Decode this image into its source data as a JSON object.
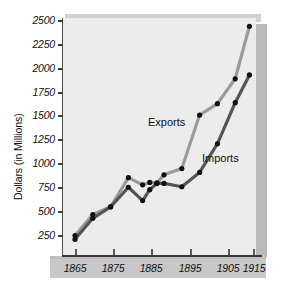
{
  "chart_data": {
    "type": "line",
    "title": "",
    "subtitle": "",
    "xlabel": "",
    "ylabel": "Dollars (in Millions)",
    "xlim": [
      1863,
      1916
    ],
    "ylim": [
      0,
      2600
    ],
    "grid": false,
    "legend_position": "inline-annotation",
    "x_ticks": [
      "1865",
      "1875",
      "1885",
      "1895",
      "1905",
      "1915"
    ],
    "x_tick_values": [
      1865,
      1875,
      1885,
      1895,
      1905,
      1915
    ],
    "y_ticks": [
      "250",
      "500",
      "750",
      "1000",
      "1250",
      "1500",
      "1750",
      "2000",
      "2250",
      "2500"
    ],
    "y_tick_values": [
      250,
      500,
      750,
      1000,
      1250,
      1500,
      1750,
      2000,
      2250,
      2500
    ],
    "x": [
      1865,
      1870,
      1875,
      1880,
      1884,
      1886,
      1888,
      1890,
      1895,
      1900,
      1905,
      1910,
      1914
    ],
    "series": [
      {
        "name": "Exports",
        "color": "#9a9a9a",
        "values": [
          250,
          470,
          550,
          855,
          780,
          805,
          800,
          885,
          950,
          1510,
          1630,
          1890,
          2440
        ]
      },
      {
        "name": "Imports",
        "color": "#555555",
        "values": [
          210,
          430,
          550,
          755,
          615,
          730,
          795,
          795,
          760,
          910,
          1210,
          1640,
          1930
        ]
      }
    ],
    "annotations": [
      {
        "text": "Exports",
        "x": 1893,
        "y": 1390
      },
      {
        "text": "Imports",
        "x": 1904,
        "y": 1020
      }
    ]
  },
  "axes": {
    "y_title": "Dollars (in Millions)"
  },
  "colors": {
    "exports_line": "#9a9a9a",
    "imports_line": "#555555",
    "marker": "#111111",
    "panel_bg": "#ececec",
    "platform": "#c8c8c8",
    "block_side": "#b9b9b9",
    "axis": "#3a3a3a",
    "page_bg": "#ffffff"
  }
}
